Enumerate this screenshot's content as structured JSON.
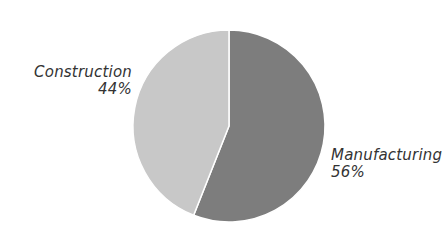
{
  "chart_data": {
    "type": "pie",
    "title": "",
    "slices": [
      {
        "label": "Manufacturing",
        "value": 56,
        "display": "56%",
        "color": "#7d7d7d"
      },
      {
        "label": "Construction",
        "value": 44,
        "display": "44%",
        "color": "#c8c8c8"
      }
    ],
    "start_angle": "12 o'clock",
    "separator_color": "#ffffff",
    "legend": "none (inline labels)"
  },
  "labels": {
    "construction": {
      "name": "Construction",
      "pct": "44%"
    },
    "manufacturing": {
      "name": "Manufacturing",
      "pct": "56%"
    }
  }
}
